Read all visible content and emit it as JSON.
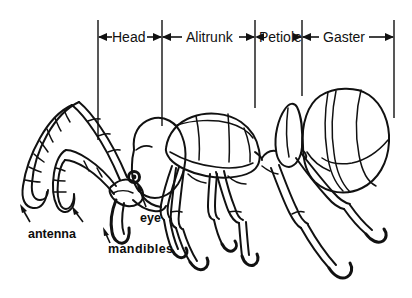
{
  "figure": {
    "type": "labeled-line-drawing",
    "background_color": "#ffffff",
    "ink_color": "#111111",
    "width": 412,
    "height": 298
  },
  "region_brackets": [
    {
      "label": "Head",
      "left_tick_x": 98,
      "right_tick_x": 162,
      "label_x": 112,
      "label_y": 30
    },
    {
      "label": "Alitrunk",
      "left_tick_x": 162,
      "right_tick_x": 255,
      "label_x": 185,
      "label_y": 30
    },
    {
      "label": "Petiole",
      "left_tick_x": 255,
      "right_tick_x": 302,
      "label_x": 258,
      "label_y": 30
    },
    {
      "label": "Gaster",
      "left_tick_x": 302,
      "right_tick_x": 394,
      "label_x": 322,
      "label_y": 30
    }
  ],
  "callouts": [
    {
      "label": "antenna",
      "label_x": 28,
      "label_y": 228
    },
    {
      "label": "eye",
      "label_x": 140,
      "label_y": 212
    },
    {
      "label": "mandibles",
      "label_x": 108,
      "label_y": 243
    }
  ]
}
